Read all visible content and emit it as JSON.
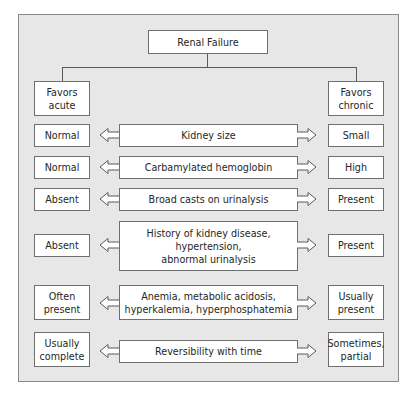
{
  "title": "Renal Failure",
  "headers": {
    "left": "Favors\nacute",
    "right": "Favors\nchronic"
  },
  "rows": [
    {
      "left": "Normal",
      "center": "Kidney size",
      "right": "Small"
    },
    {
      "left": "Normal",
      "center": "Carbamylated hemoglobin",
      "right": "High"
    },
    {
      "left": "Absent",
      "center": "Broad casts on urinalysis",
      "right": "Present"
    },
    {
      "left": "Absent",
      "center": "History of kidney disease,\nhypertension,\nabnormal urinalysis",
      "right": "Present"
    },
    {
      "left": "Often\npresent",
      "center": "Anemia, metabolic acidosis,\nhyperkalemia, hyperphosphatemia",
      "right": "Usually\npresent"
    },
    {
      "left": "Usually\ncomplete",
      "center": "Reversibility with time",
      "right": "Sometimes,\npartial"
    }
  ],
  "colors": {
    "panel_bg": "#e7e7e7",
    "box_bg": "#ffffff",
    "border": "#6f6f6f",
    "text": "#262626"
  }
}
